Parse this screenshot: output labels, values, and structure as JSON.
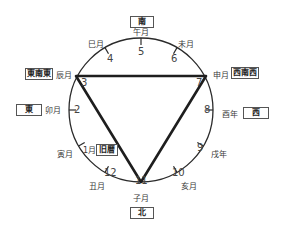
{
  "directions": {
    "south": "南",
    "north": "北",
    "east": "東",
    "west": "西",
    "ese": "東南東",
    "wsw": "西南西",
    "old_calendar": "旧暦"
  },
  "months": [
    {
      "num": "1",
      "name": "寅月"
    },
    {
      "num": "2",
      "name": "卯月"
    },
    {
      "num": "3",
      "name": "辰月"
    },
    {
      "num": "4",
      "name": "巳月"
    },
    {
      "num": "5",
      "name": "午月"
    },
    {
      "num": "6",
      "name": "未月"
    },
    {
      "num": "7",
      "name": "申月"
    },
    {
      "num": "8",
      "name": "酉年"
    },
    {
      "num": "9",
      "name": "戌年"
    },
    {
      "num": "10",
      "name": "亥月"
    },
    {
      "num": "11",
      "name": "子月"
    },
    {
      "num": "12",
      "name": "丑月"
    }
  ],
  "extra_labels": {
    "one_month": "1月"
  },
  "colors": {
    "line": "#2a2a2a",
    "triangle": "#1e1e1e"
  },
  "triangle_vertices": [
    "3",
    "7",
    "11"
  ]
}
